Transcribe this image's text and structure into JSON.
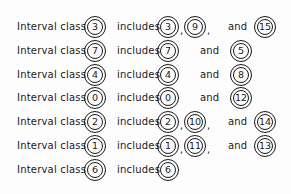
{
  "label_text": "Interval class",
  "includes_text": "includes",
  "and_text": "and",
  "rows": [
    {
      "class": "3",
      "members": [
        "3",
        "9"
      ],
      "last": "15"
    },
    {
      "class": "7",
      "members": [
        "7"
      ],
      "last": "5"
    },
    {
      "class": "4",
      "members": [
        "4"
      ],
      "last": "8"
    },
    {
      "class": "0",
      "members": [
        "0"
      ],
      "last": "12"
    },
    {
      "class": "2",
      "members": [
        "2",
        "10"
      ],
      "last": "14"
    },
    {
      "class": "1",
      "members": [
        "1",
        "11"
      ],
      "last": "13"
    },
    {
      "class": "6",
      "members": [
        "6"
      ],
      "last": null
    }
  ]
}
